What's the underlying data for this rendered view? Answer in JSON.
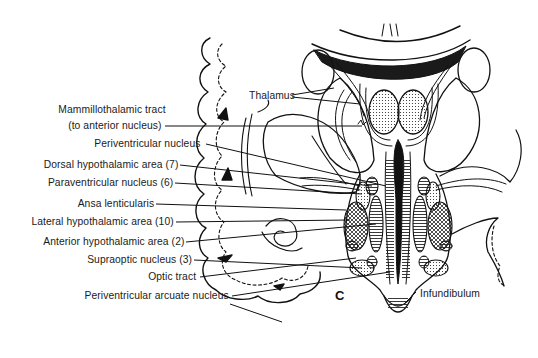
{
  "figure": {
    "panel_letter": "C",
    "labels": [
      {
        "id": "thalamus",
        "text": "Thalamus"
      },
      {
        "id": "mammillothalamic_tract_1",
        "text": "Mammillothalamic tract"
      },
      {
        "id": "mammillothalamic_tract_2",
        "text": "(to anterior nucleus)"
      },
      {
        "id": "periventricular_nucleus",
        "text": "Periventricular nucleus"
      },
      {
        "id": "dorsal_hypothalamic_area",
        "text": "Dorsal hypothalamic area (7)"
      },
      {
        "id": "paraventricular_nucleus",
        "text": "Paraventricular nucleus (6)"
      },
      {
        "id": "ansa_lenticularis",
        "text": "Ansa lenticularis"
      },
      {
        "id": "lateral_hypothalamic_area",
        "text": "Lateral hypothalamic area (10)"
      },
      {
        "id": "anterior_hypothalamic_area",
        "text": "Anterior hypothalamic area (2)"
      },
      {
        "id": "supraoptic_nucleus",
        "text": "Supraoptic nucleus (3)"
      },
      {
        "id": "optic_tract",
        "text": "Optic tract"
      },
      {
        "id": "periventricular_arcuate_nucleus",
        "text": "Periventricular arcuate nucleus"
      },
      {
        "id": "infundibulum",
        "text": "Infundibulum"
      }
    ]
  }
}
